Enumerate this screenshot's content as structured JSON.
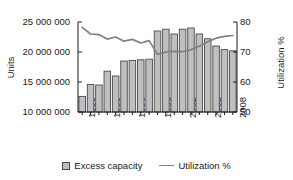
{
  "chart_data": {
    "type": "bar",
    "title": "",
    "subtitle": "",
    "xlabel": "",
    "ylabel": "Units",
    "y2label": "Utilization %",
    "grid": false,
    "legend_position": "bottom",
    "ylim": [
      10000000,
      25000000
    ],
    "y2lim": [
      50,
      80
    ],
    "ytick_labels": [
      "25 000 000",
      "20 000 000",
      "15 000 000",
      "10 000 000"
    ],
    "ytick_values": [
      25000000,
      20000000,
      15000000,
      10000000
    ],
    "y2tick_labels": [
      "80",
      "70",
      "60",
      "50"
    ],
    "y2tick_values": [
      80,
      70,
      60,
      50
    ],
    "categories": [
      "1990",
      "1991",
      "1992",
      "1993",
      "1994",
      "1995",
      "1996",
      "1997",
      "1998",
      "1999",
      "2000",
      "2001",
      "2002",
      "2003",
      "2004",
      "2005",
      "2006",
      "2007",
      "2008"
    ],
    "xtick_labels": [
      "1990",
      "1993",
      "1996",
      "1999",
      "2002",
      "2005",
      "2008"
    ],
    "xtick_label_interval": 3,
    "series": [
      {
        "name": "Excess capacity",
        "type": "bar",
        "axis": "left",
        "color": "#bfbfbf",
        "edge_color": "#4a4a4a",
        "values": [
          12600000,
          14600000,
          14500000,
          16800000,
          16000000,
          18500000,
          18600000,
          18700000,
          18800000,
          23500000,
          23800000,
          23000000,
          23800000,
          24000000,
          23000000,
          22200000,
          21000000,
          20400000,
          20200000
        ]
      },
      {
        "name": "Utilization %",
        "type": "line",
        "axis": "right",
        "color": "#808080",
        "values": [
          78.2,
          76.0,
          75.8,
          74.3,
          75.0,
          73.6,
          74.2,
          73.0,
          73.8,
          69.2,
          70.0,
          70.2,
          70.1,
          70.8,
          71.9,
          73.4,
          74.6,
          75.2,
          75.5
        ]
      }
    ]
  },
  "legend": {
    "items": [
      {
        "label": "Excess capacity",
        "marker": "bar-swatch-icon"
      },
      {
        "label": "Utilization %",
        "marker": "line-swatch-icon"
      }
    ]
  }
}
